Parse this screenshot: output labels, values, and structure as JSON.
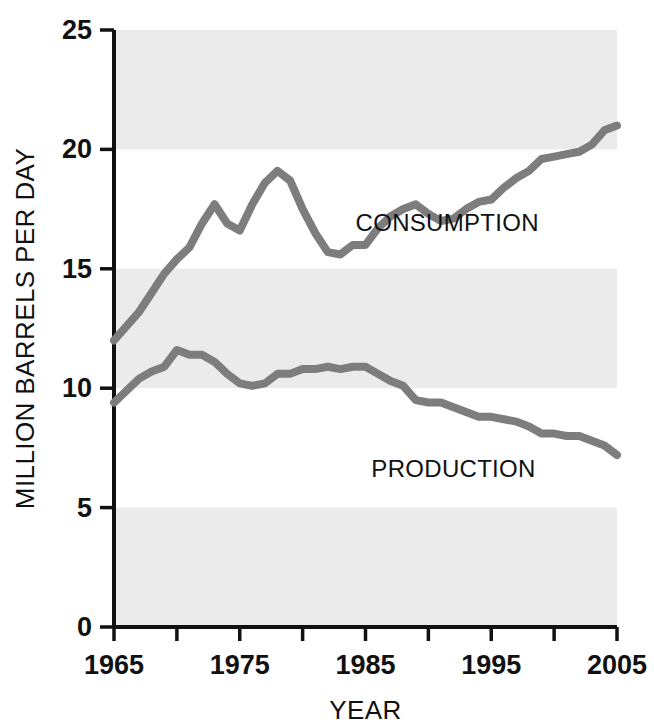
{
  "chart_data": {
    "type": "line",
    "title": "",
    "subtitle": "",
    "xlabel": "YEAR",
    "ylabel": "MILLION BARRELS PER DAY",
    "xlim": [
      1965,
      2005
    ],
    "ylim": [
      0,
      25
    ],
    "xticks": [
      1965,
      1970,
      1975,
      1980,
      1985,
      1990,
      1995,
      2000,
      2005
    ],
    "xtick_labels": [
      "1965",
      "",
      "1975",
      "",
      "1985",
      "",
      "1995",
      "",
      "2005"
    ],
    "yticks": [
      0,
      5,
      10,
      15,
      20,
      25
    ],
    "ytick_labels": [
      "0",
      "5",
      "10",
      "15",
      "20",
      "25"
    ],
    "grid": false,
    "banded_background": true,
    "band_color": "#ebebeb",
    "band_ranges": [
      [
        0,
        5
      ],
      [
        10,
        15
      ],
      [
        20,
        25
      ]
    ],
    "legend_position": "inline-annotation",
    "line_color": "#7d7d7d",
    "line_width": 8,
    "axis_color": "#111111",
    "x": [
      1965,
      1966,
      1967,
      1968,
      1969,
      1970,
      1971,
      1972,
      1973,
      1974,
      1975,
      1976,
      1977,
      1978,
      1979,
      1980,
      1981,
      1982,
      1983,
      1984,
      1985,
      1986,
      1987,
      1988,
      1989,
      1990,
      1991,
      1992,
      1993,
      1994,
      1995,
      1996,
      1997,
      1998,
      1999,
      2000,
      2001,
      2002,
      2003,
      2004,
      2005
    ],
    "series": [
      {
        "name": "CONSUMPTION",
        "label": "CONSUMPTION",
        "color": "#7d7d7d",
        "label_x": 1991.5,
        "label_y": 16.6,
        "values": [
          12.0,
          12.6,
          13.2,
          14.0,
          14.8,
          15.4,
          15.9,
          16.9,
          17.7,
          16.9,
          16.6,
          17.7,
          18.6,
          19.1,
          18.7,
          17.5,
          16.5,
          15.7,
          15.6,
          16.0,
          16.0,
          16.7,
          17.2,
          17.5,
          17.7,
          17.3,
          17.0,
          17.1,
          17.5,
          17.8,
          17.9,
          18.4,
          18.8,
          19.1,
          19.6,
          19.7,
          19.8,
          19.9,
          20.2,
          20.8,
          21.0
        ]
      },
      {
        "name": "PRODUCTION",
        "label": "PRODUCTION",
        "color": "#7d7d7d",
        "label_x": 1992.0,
        "label_y": 6.3,
        "values": [
          9.4,
          9.9,
          10.4,
          10.7,
          10.9,
          11.6,
          11.4,
          11.4,
          11.1,
          10.6,
          10.2,
          10.1,
          10.2,
          10.6,
          10.6,
          10.8,
          10.8,
          10.9,
          10.8,
          10.9,
          10.9,
          10.6,
          10.3,
          10.1,
          9.5,
          9.4,
          9.4,
          9.2,
          9.0,
          8.8,
          8.8,
          8.7,
          8.6,
          8.4,
          8.1,
          8.1,
          8.0,
          8.0,
          7.8,
          7.6,
          7.2
        ]
      }
    ]
  }
}
